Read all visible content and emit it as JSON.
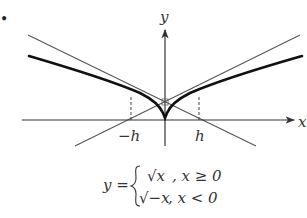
{
  "diagram": {
    "bullet": "•",
    "axes": {
      "x_label": "x",
      "y_label": "y"
    },
    "ticks": {
      "neg_h": "−h",
      "pos_h": "h"
    },
    "curve": "y = √|x|",
    "formula": {
      "lhs": "y =",
      "case1_expr": "√x",
      "case1_cond": ", x ≥ 0",
      "case2_expr": "√−x",
      "case2_cond": ", x < 0"
    },
    "colors": {
      "curve": "#111111",
      "tangent": "#555555",
      "axis": "#333333"
    }
  }
}
